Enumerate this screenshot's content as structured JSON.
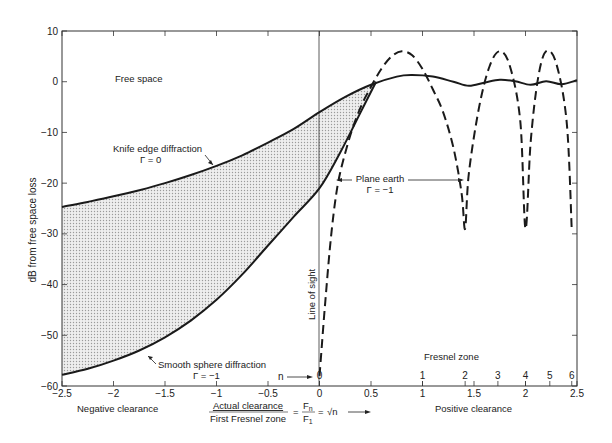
{
  "chart_data": {
    "type": "line",
    "title": "",
    "xlabel": "Actual clearance / First Fresnel zone = F_n / F_1 = √n",
    "ylabel": "dB from free space loss",
    "xlim": [
      -2.5,
      2.5
    ],
    "ylim": [
      -60,
      10
    ],
    "grid": false,
    "x_ticks": [
      -2.5,
      -2,
      -1.5,
      -1,
      -0.5,
      0,
      0.5,
      1,
      1.5,
      2,
      2.5
    ],
    "x_tick_labels": [
      "-2.5",
      "-2",
      "-1.5",
      "-1",
      "-0.5",
      "0",
      "0.5",
      "1",
      "1.5",
      "2",
      "2.5"
    ],
    "y_ticks": [
      10,
      0,
      -10,
      -20,
      -30,
      -40,
      -50,
      -60
    ],
    "y_tick_labels": [
      "10",
      "0",
      "-10",
      "-20",
      "-30",
      "-40",
      "-50",
      "-60"
    ],
    "secondary_x_axis": {
      "label": "Fresnel zone",
      "ticks": [
        {
          "n": 0,
          "x": 0
        },
        {
          "n": 1,
          "x": 1.0
        },
        {
          "n": 2,
          "x": 1.414
        },
        {
          "n": 3,
          "x": 1.732
        },
        {
          "n": 4,
          "x": 2.0
        },
        {
          "n": 5,
          "x": 2.236
        },
        {
          "n": 6,
          "x": 2.449
        }
      ],
      "n_label": "n"
    },
    "region_labels": {
      "negative": "Negative clearance",
      "positive": "Positive clearance"
    },
    "series": [
      {
        "name": "Knife edge diffraction",
        "subtitle": "Γ = 0",
        "style": "solid",
        "x": [
          -2.5,
          -2.25,
          -2.0,
          -1.75,
          -1.5,
          -1.25,
          -1.0,
          -0.75,
          -0.5,
          -0.25,
          0.0,
          0.25,
          0.5,
          0.75,
          0.9,
          1.1,
          1.3,
          1.45,
          1.6,
          1.75,
          1.9,
          2.05,
          2.2,
          2.35,
          2.5
        ],
        "values": [
          -24.7,
          -23.7,
          -22.6,
          -21.4,
          -20.0,
          -18.4,
          -16.6,
          -14.5,
          -12.0,
          -9.3,
          -6.0,
          -3.0,
          -0.6,
          1.0,
          1.3,
          1.0,
          0.0,
          -0.8,
          -0.2,
          0.4,
          0.1,
          -0.6,
          0.1,
          -0.5,
          0.3
        ]
      },
      {
        "name": "Smooth sphere diffraction",
        "subtitle": "Γ = −1",
        "style": "solid",
        "x": [
          -2.5,
          -2.25,
          -2.0,
          -1.75,
          -1.5,
          -1.25,
          -1.0,
          -0.75,
          -0.5,
          -0.25,
          0.0,
          0.2,
          0.4,
          0.55
        ],
        "values": [
          -57.8,
          -56.6,
          -55.0,
          -53.0,
          -50.4,
          -47.1,
          -43.0,
          -38.0,
          -32.3,
          -26.6,
          -21.0,
          -14.0,
          -6.0,
          0.0
        ]
      },
      {
        "name": "Plane earth",
        "subtitle": "Γ = −1",
        "style": "dashed",
        "x": [
          0.0,
          0.05,
          0.1,
          0.15,
          0.2,
          0.3,
          0.4,
          0.5,
          0.6,
          0.7,
          0.8,
          0.9,
          1.0,
          1.1,
          1.2,
          1.3,
          1.38,
          1.414,
          1.45,
          1.55,
          1.65,
          1.75,
          1.85,
          1.95,
          2.0,
          2.05,
          2.12,
          2.2,
          2.3,
          2.4,
          2.449
        ],
        "values": [
          -58,
          -45,
          -33,
          -24,
          -18,
          -10.5,
          -5.0,
          -1.0,
          2.5,
          5.0,
          6.0,
          5.2,
          2.5,
          -1.5,
          -6.0,
          -13.0,
          -22.0,
          -29.0,
          -18.0,
          -5.0,
          3.0,
          6.0,
          3.0,
          -8.0,
          -29.0,
          -12.0,
          0.5,
          6.0,
          3.5,
          -8.0,
          -29.0
        ]
      }
    ],
    "annotations": [
      {
        "text": "Free space",
        "x": -1.65,
        "y": 0.5
      },
      {
        "text": "Knife edge diffraction",
        "x": -1.4,
        "y": -13.5
      },
      {
        "text": "Γ = 0",
        "x": -1.1,
        "y": -16.5
      },
      {
        "text": "Smooth sphere diffraction",
        "x": -1.25,
        "y": -53.5
      },
      {
        "text": "Γ = −1",
        "x": -0.95,
        "y": -56.5
      },
      {
        "text": "Plane earth",
        "x": 0.9,
        "y": -17.5
      },
      {
        "text": "Γ = −1",
        "x": 0.9,
        "y": -20.5
      },
      {
        "text": "Line of sight",
        "x": 0.07,
        "y": -40
      }
    ],
    "shaded_region": "between knife edge and smooth sphere diffraction curves"
  },
  "labels": {
    "free_space": "Free space",
    "knife_edge": "Knife edge diffraction",
    "knife_edge_gamma": "Γ = 0",
    "smooth_sphere": "Smooth sphere diffraction",
    "smooth_sphere_gamma": "Γ = −1",
    "plane_earth": "Plane earth",
    "plane_earth_gamma": "Γ = −1",
    "line_of_sight": "Line of sight",
    "ylabel": "dB from free space loss",
    "fresnel_zone": "Fresnel zone",
    "n_marker": "n",
    "negative_clearance": "Negative clearance",
    "positive_clearance": "Positive clearance",
    "x_numerator": "Actual clearance",
    "x_denominator": "First Fresnel zone",
    "fn": "F",
    "fn_sub": "n",
    "f1": "F",
    "f1_sub": "1",
    "sqrt_n": "√n",
    "equals": "="
  },
  "colors": {
    "line": "#1a1a1a",
    "shade": "#d9d9d9",
    "axis": "#333333"
  }
}
